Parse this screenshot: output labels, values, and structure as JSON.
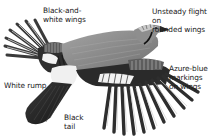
{
  "figure": {
    "palette": {
      "background": "#ffffff",
      "body_grey": "#8a8a8a",
      "dark_feather": "#2a2a2a",
      "white_patch": "#f2f2f2",
      "text": "#1a1a1a"
    },
    "labels": [
      {
        "id": "wings",
        "text": "Black-and-\nwhite wings"
      },
      {
        "id": "flight",
        "text": "Unsteady flight on\nrounded wings"
      },
      {
        "id": "azure",
        "text": "Azure-blue\nmarkings\non wings"
      },
      {
        "id": "rump",
        "text": "White rump"
      },
      {
        "id": "tail",
        "text": "Black\ntail"
      }
    ]
  }
}
